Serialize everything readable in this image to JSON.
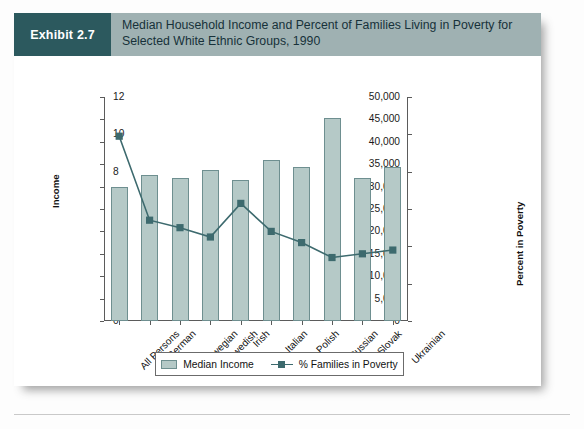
{
  "exhibit": {
    "tag": "Exhibit 2.7",
    "title_line1": "Median Household Income and Percent of Families Living in Poverty for",
    "title_line2": "Selected White Ethnic Groups, 1990"
  },
  "colors": {
    "tag_bg": "#2c595e",
    "header_bg": "#9fb1b2",
    "bar_fill": "#b5c9c7",
    "bar_stroke": "#6e8f90",
    "line": "#3d6a6e",
    "marker": "#3d6a6e",
    "axis": "#5b5b5b"
  },
  "legend": {
    "items": [
      {
        "label": "Median Income",
        "type": "bar"
      },
      {
        "label": "% Families in Poverty",
        "type": "line"
      }
    ]
  },
  "chart_data": {
    "type": "bar",
    "title": "Median Household Income and Percent of Families Living in Poverty for Selected White Ethnic Groups, 1990",
    "xlabel": "",
    "ylabel": "Income",
    "y2label": "Percent in Poverty",
    "ylim": [
      0,
      50000
    ],
    "y2lim": [
      0,
      12
    ],
    "yticks": [
      "0",
      "5,000",
      "10,000",
      "15,000",
      "20,000",
      "25,000",
      "30,000",
      "35,000",
      "40,000",
      "45,000",
      "50,000"
    ],
    "ytick_values": [
      0,
      5000,
      10000,
      15000,
      20000,
      25000,
      30000,
      35000,
      40000,
      45000,
      50000
    ],
    "y2ticks": [
      "0",
      "2",
      "4",
      "6",
      "8",
      "10",
      "12"
    ],
    "y2tick_values": [
      0,
      2,
      4,
      6,
      8,
      10,
      12
    ],
    "grid": false,
    "legend_position": "bottom",
    "categories": [
      "All Persons",
      "German",
      "Norwegian",
      "Swedish",
      "Irish",
      "Italian",
      "Polish",
      "Russian",
      "Slovak",
      "Ukrainian"
    ],
    "series": [
      {
        "name": "Median Income",
        "axis": "left",
        "type": "bar",
        "values": [
          29900,
          32500,
          31900,
          33700,
          31500,
          36000,
          34400,
          45400,
          31900,
          34300
        ]
      },
      {
        "name": "% Families in Poverty",
        "axis": "right",
        "type": "line",
        "values": [
          9.9,
          5.4,
          5.0,
          4.5,
          6.3,
          4.8,
          4.2,
          3.4,
          3.6,
          3.8
        ]
      }
    ]
  }
}
